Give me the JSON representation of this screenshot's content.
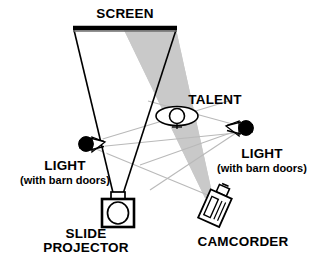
{
  "diagram": {
    "type": "floor-plan-schematic",
    "background_color": "#ffffff",
    "ink_color": "#000000",
    "beam_fill_color": "#c8c8c8",
    "light_ray_color": "#b4b4b4"
  },
  "labels": {
    "screen": "SCREEN",
    "talent": "TALENT",
    "light_left_line1": "LIGHT",
    "light_left_line2": "(with barn doors)",
    "light_right_line1": "LIGHT",
    "light_right_line2": "(with barn doors)",
    "slide_projector_line1": "SLIDE",
    "slide_projector_line2": "PROJECTOR",
    "camcorder": "CAMCORDER"
  },
  "elements": {
    "screen": {
      "name": "screen-bar",
      "x1": 73,
      "y1": 28,
      "x2": 176,
      "y2": 28
    },
    "projector": {
      "name": "slide-projector",
      "x": 118,
      "y": 206
    },
    "camcorder": {
      "name": "camcorder",
      "x": 216,
      "y": 207
    },
    "talent": {
      "name": "talent-figure",
      "x": 177,
      "y": 116
    },
    "light_left": {
      "name": "light-left",
      "x": 86,
      "y": 144
    },
    "light_right": {
      "name": "light-right",
      "x": 245,
      "y": 128
    }
  }
}
